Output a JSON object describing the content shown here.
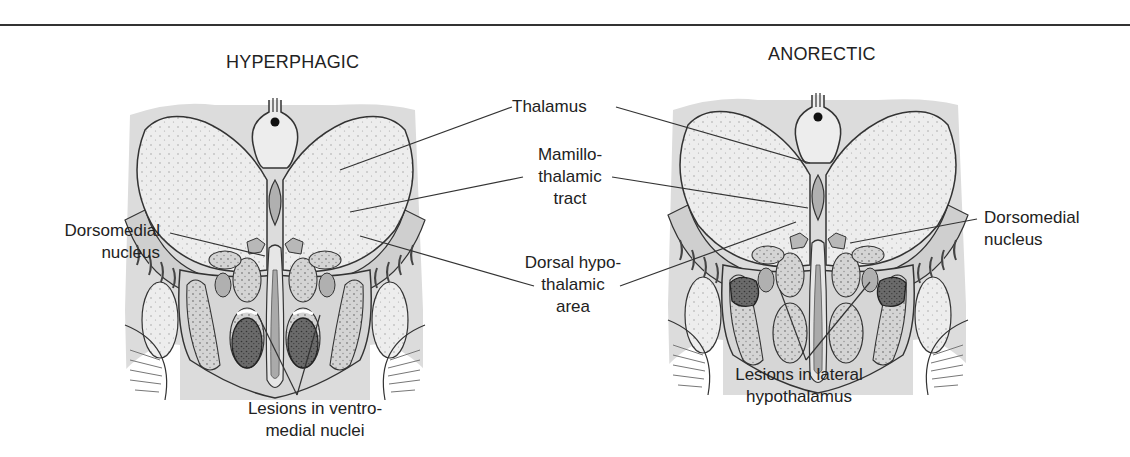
{
  "figure": {
    "panels": [
      {
        "id": "left",
        "title": "HYPERPHAGIC"
      },
      {
        "id": "right",
        "title": "ANORECTIC"
      }
    ],
    "labels": {
      "thalamus": "Thalamus",
      "mamillo_line1": "Mamillo-",
      "mamillo_line2": "thalamic",
      "mamillo_line3": "tract",
      "dorsal_line1": "Dorsal hypo-",
      "dorsal_line2": "thalamic",
      "dorsal_line3": "area",
      "dm_left_line1": "Dorsomedial",
      "dm_left_line2": "nucleus",
      "dm_right_line1": "Dorsomedial",
      "dm_right_line2": "nucleus",
      "vmn_line1": "Lesions in ventro-",
      "vmn_line2": "medial nuclei",
      "lh_line1": "Lesions in lateral",
      "lh_line2": "hypothalamus"
    },
    "colors": {
      "outline": "#333333",
      "background_gray": "#dcdcdc",
      "thalamus_fill": "#ededed",
      "nucleus_fill": "#d2d2d2",
      "lesion_fill": "#6a6a6a",
      "ventricle_fill": "#b0b0b0"
    }
  }
}
